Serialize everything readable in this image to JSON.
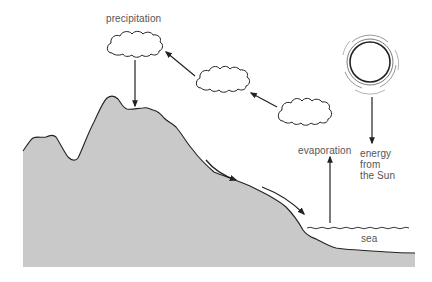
{
  "diagram": {
    "labels": {
      "precipitation": "precipitation",
      "evaporation": "evaporation",
      "energy_line1": "energy",
      "energy_line2": "from",
      "energy_line3": "the Sun",
      "sea": "sea"
    },
    "elements": {
      "clouds": [
        "cloud-1",
        "cloud-2",
        "cloud-3"
      ],
      "sun": "sun",
      "land": "mountain-landmass",
      "sea": "sea"
    },
    "colors": {
      "land": "#c9c9c9",
      "stroke": "#222222",
      "label": "#555555",
      "background": "#ffffff"
    }
  }
}
